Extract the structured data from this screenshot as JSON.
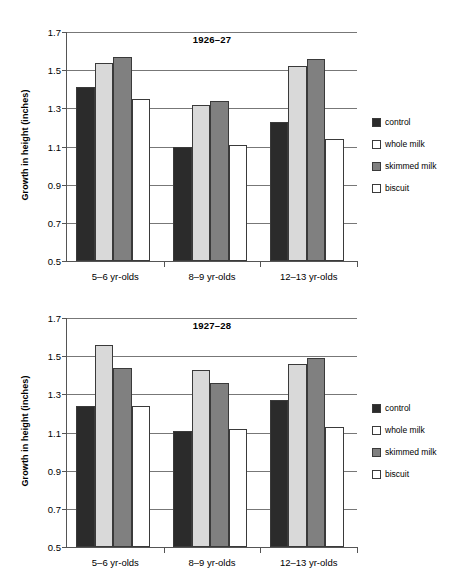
{
  "chart_data": [
    {
      "type": "bar",
      "title": "1926–27",
      "xlabel": "",
      "ylabel": "Growth in height (inches)",
      "ylim": [
        0.5,
        1.7
      ],
      "yticks": [
        0.5,
        0.7,
        0.9,
        1.1,
        1.3,
        1.5,
        1.7
      ],
      "ytick_labels": [
        "0.5",
        "0.7",
        "0.9",
        "1.1",
        "1.3",
        "1.5",
        "1.7"
      ],
      "grid": true,
      "legend_position": "right",
      "categories": [
        "5–6 yr-olds",
        "8–9 yr-olds",
        "12–13 yr-olds"
      ],
      "series": [
        {
          "name": "control",
          "color": "#2b2b2b",
          "values": [
            1.41,
            1.1,
            1.23
          ]
        },
        {
          "name": "whole milk",
          "color": "#d9d9d9",
          "values": [
            1.54,
            1.32,
            1.52
          ]
        },
        {
          "name": "skimmed milk",
          "color": "#808080",
          "values": [
            1.57,
            1.34,
            1.56
          ]
        },
        {
          "name": "biscuit",
          "color": "#ffffff",
          "values": [
            1.35,
            1.11,
            1.14
          ]
        }
      ]
    },
    {
      "type": "bar",
      "title": "1927–28",
      "xlabel": "",
      "ylabel": "Growth in height (inches)",
      "ylim": [
        0.5,
        1.7
      ],
      "yticks": [
        0.5,
        0.7,
        0.9,
        1.1,
        1.3,
        1.5,
        1.7
      ],
      "ytick_labels": [
        "0.5",
        "0.7",
        "0.9",
        "1.1",
        "1.3",
        "1.5",
        "1.7"
      ],
      "grid": true,
      "legend_position": "right",
      "categories": [
        "5–6 yr-olds",
        "8–9 yr-olds",
        "12–13 yr-olds"
      ],
      "series": [
        {
          "name": "control",
          "color": "#2b2b2b",
          "values": [
            1.24,
            1.11,
            1.27
          ]
        },
        {
          "name": "whole milk",
          "color": "#d9d9d9",
          "values": [
            1.56,
            1.43,
            1.46
          ]
        },
        {
          "name": "skimmed milk",
          "color": "#808080",
          "values": [
            1.44,
            1.36,
            1.49
          ]
        },
        {
          "name": "biscuit",
          "color": "#ffffff",
          "values": [
            1.24,
            1.12,
            1.13
          ]
        }
      ]
    }
  ],
  "legend": {
    "items": [
      {
        "label": "control",
        "color": "#2b2b2b"
      },
      {
        "label": "whole milk",
        "color": "#ffffff"
      },
      {
        "label": "skimmed milk",
        "color": "#808080"
      },
      {
        "label": "biscuit",
        "color": "#ffffff"
      }
    ]
  }
}
